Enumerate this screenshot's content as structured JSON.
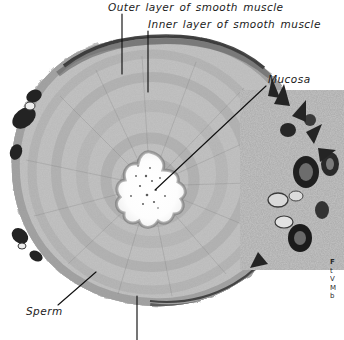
{
  "figure": {
    "kind": "histology-micrograph",
    "background_color": "#ffffff",
    "ink_color": "#1a1a1a",
    "tissue_tone_light": "#d8d8d8",
    "tissue_tone_mid": "#8f8f8f",
    "tissue_tone_dark": "#2e2e2e"
  },
  "labels": {
    "outer_muscle": "Outer layer of smooth muscle",
    "inner_muscle": "Inner layer of smooth muscle",
    "mucosa": "Mucosa",
    "sperm": "Sperm"
  },
  "caption": {
    "line1": "F",
    "line2": "t",
    "line3": "V",
    "line4": "M",
    "line5": "b"
  }
}
